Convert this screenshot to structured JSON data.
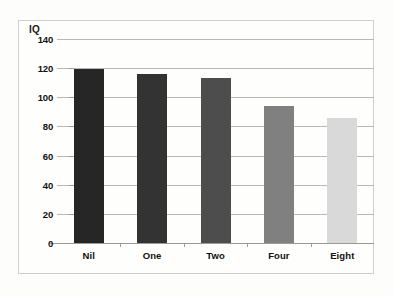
{
  "chart_data": {
    "type": "bar",
    "title": "",
    "subtitle": "",
    "xlabel": "",
    "ylabel": "IQ",
    "categories": [
      "Nil",
      "One",
      "Two",
      "Four",
      "Eight"
    ],
    "values": [
      119,
      116,
      113,
      94,
      86
    ],
    "series": [
      {
        "name": "IQ",
        "values": [
          119,
          116,
          113,
          94,
          86
        ]
      }
    ],
    "ylim": [
      0,
      140
    ],
    "yticks": [
      0,
      20,
      40,
      60,
      80,
      100,
      120,
      140
    ],
    "ytick_labels": [
      "0",
      "20",
      "40",
      "60",
      "80",
      "100",
      "120",
      "140"
    ],
    "grid": "horizontal",
    "legend": "none",
    "bar_colors": [
      "#262626",
      "#333333",
      "#4d4d4d",
      "#808080",
      "#d9d9d9"
    ],
    "annotations": []
  },
  "frame": {
    "border_color": "#cfcfcc",
    "background": "#fefefd"
  },
  "scan": {
    "ghost_text": ""
  }
}
